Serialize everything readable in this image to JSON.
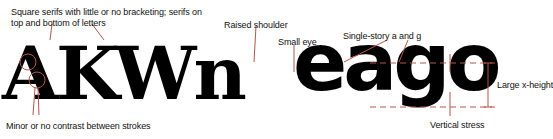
{
  "specimen": {
    "slab_text": "AKWn",
    "geometric_text": "eago"
  },
  "annotations": {
    "square_serifs": "Square serifs with little or no bracketing; serifs on",
    "square_serifs_line2": "top and bottom of letters",
    "raised_shoulder": "Raised shoulder",
    "small_eye": "Small eye",
    "single_story": "Single-story a and g",
    "large_x_height": "Large x-height",
    "minor_contrast": "Minor or no contrast between strokes",
    "vertical_stress": "Vertical stress"
  },
  "colors": {
    "annotation_line": "#b5544a",
    "text": "#000000",
    "background": "#ffffff"
  }
}
